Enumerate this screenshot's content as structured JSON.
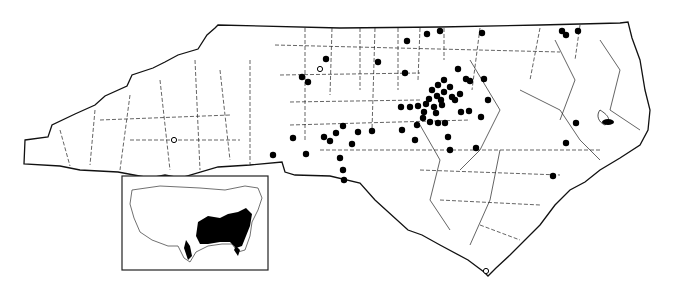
{
  "map": {
    "region": "North Carolina",
    "type": "county distribution map",
    "legend": {
      "filled_dot": "record (filled circle)",
      "open_dot": "record (open circle)"
    },
    "filled_dots": [
      [
        302,
        77
      ],
      [
        308,
        82
      ],
      [
        326,
        59
      ],
      [
        378,
        62
      ],
      [
        407,
        41
      ],
      [
        427,
        34
      ],
      [
        440,
        31
      ],
      [
        482,
        33
      ],
      [
        405,
        73
      ],
      [
        458,
        69
      ],
      [
        466,
        79
      ],
      [
        470,
        81
      ],
      [
        444,
        80
      ],
      [
        438,
        85
      ],
      [
        432,
        90
      ],
      [
        450,
        87
      ],
      [
        444,
        92
      ],
      [
        437,
        96
      ],
      [
        452,
        97
      ],
      [
        429,
        99
      ],
      [
        441,
        100
      ],
      [
        426,
        104
      ],
      [
        434,
        107
      ],
      [
        442,
        105
      ],
      [
        455,
        100
      ],
      [
        460,
        94
      ],
      [
        410,
        107
      ],
      [
        401,
        107
      ],
      [
        418,
        106
      ],
      [
        424,
        112
      ],
      [
        436,
        113
      ],
      [
        423,
        118
      ],
      [
        430,
        122
      ],
      [
        438,
        123
      ],
      [
        445,
        123
      ],
      [
        484,
        79
      ],
      [
        488,
        100
      ],
      [
        469,
        111
      ],
      [
        417,
        125
      ],
      [
        402,
        130
      ],
      [
        415,
        140
      ],
      [
        448,
        137
      ],
      [
        450,
        150
      ],
      [
        476,
        148
      ],
      [
        481,
        117
      ],
      [
        358,
        132
      ],
      [
        372,
        131
      ],
      [
        343,
        126
      ],
      [
        336,
        133
      ],
      [
        352,
        144
      ],
      [
        324,
        137
      ],
      [
        330,
        141
      ],
      [
        340,
        158
      ],
      [
        343,
        170
      ],
      [
        344,
        180
      ],
      [
        273,
        155
      ],
      [
        306,
        154
      ],
      [
        293,
        138
      ],
      [
        562,
        31
      ],
      [
        566,
        35
      ],
      [
        578,
        31
      ],
      [
        576,
        123
      ],
      [
        566,
        143
      ],
      [
        553,
        176
      ],
      [
        461,
        112
      ]
    ],
    "open_dots": [
      [
        320,
        69
      ],
      [
        174,
        140
      ],
      [
        486,
        271
      ]
    ]
  },
  "inset": {
    "label": "United States range inset",
    "highlight": "Southeastern United States (shaded range)"
  }
}
